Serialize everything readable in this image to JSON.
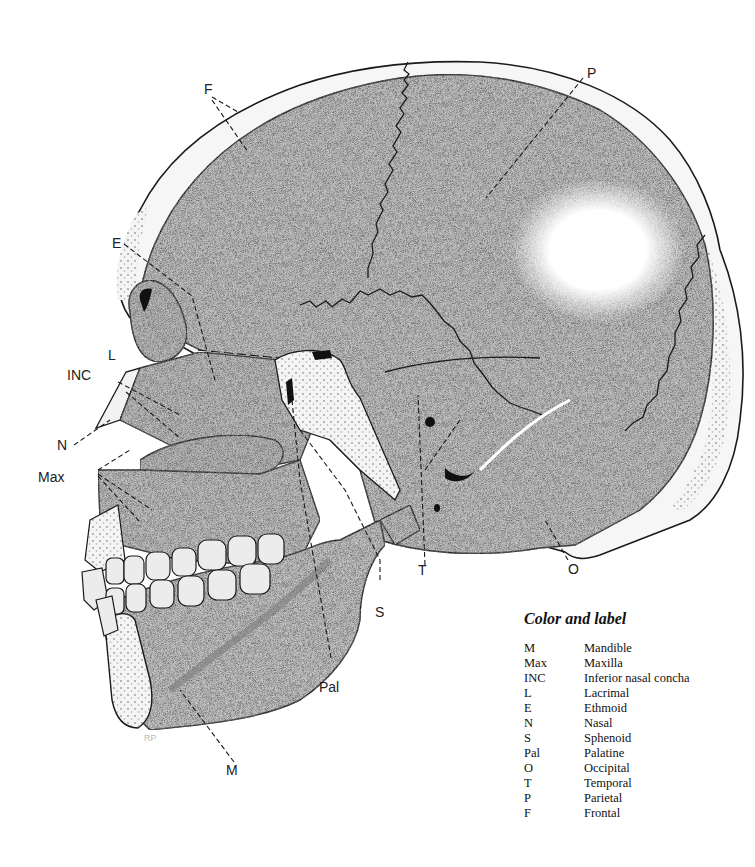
{
  "figure": {
    "type": "anatomical-diagram",
    "colors": {
      "ink": "#1a1a1a",
      "bone_fill": "#c9c9c9",
      "bone_dark": "#a9a9a9",
      "cut_bone": "#f2f2f2",
      "background": "#ffffff"
    }
  },
  "labels": {
    "F": "F",
    "P": "P",
    "E": "E",
    "L": "L",
    "INC": "INC",
    "N": "N",
    "Max": "Max",
    "T": "T",
    "O": "O",
    "S": "S",
    "Pal": "Pal",
    "M": "M"
  },
  "artist_initials": "RP",
  "legend": {
    "title": "Color and label",
    "items": [
      {
        "abbr": "M",
        "name": "Mandible"
      },
      {
        "abbr": "Max",
        "name": "Maxilla"
      },
      {
        "abbr": "INC",
        "name": "Inferior nasal concha"
      },
      {
        "abbr": "L",
        "name": "Lacrimal"
      },
      {
        "abbr": "E",
        "name": "Ethmoid"
      },
      {
        "abbr": "N",
        "name": "Nasal"
      },
      {
        "abbr": "S",
        "name": "Sphenoid"
      },
      {
        "abbr": "Pal",
        "name": "Palatine"
      },
      {
        "abbr": "O",
        "name": "Occipital"
      },
      {
        "abbr": "T",
        "name": "Temporal"
      },
      {
        "abbr": "P",
        "name": "Parietal"
      },
      {
        "abbr": "F",
        "name": "Frontal"
      }
    ]
  }
}
